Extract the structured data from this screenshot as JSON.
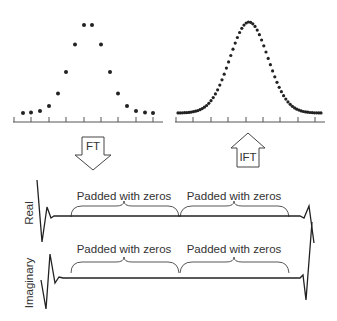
{
  "diagram": {
    "left_plot": {
      "name": "original-time-signal",
      "points_count": 16,
      "dot_color": "#222222"
    },
    "right_plot": {
      "name": "interpolated-time-signal",
      "dot_color": "#222222"
    },
    "arrows": {
      "ft": {
        "label": "FT",
        "direction": "down"
      },
      "ift": {
        "label": "IFT",
        "direction": "up"
      }
    },
    "spectra": {
      "real": {
        "axis_label": "Real",
        "brace_labels": [
          "Padded with zeros",
          "Padded with zeros"
        ]
      },
      "imaginary": {
        "axis_label": "Imaginary",
        "brace_labels": [
          "Padded with zeros",
          "Padded with zeros"
        ]
      }
    },
    "colors": {
      "line": "#222222",
      "brace": "#444444",
      "text": "#333333",
      "background": "#ffffff"
    }
  }
}
